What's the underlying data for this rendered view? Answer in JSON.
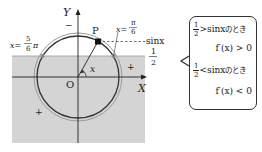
{
  "diagram": {
    "axes": {
      "x_label": "X",
      "y_label": "Y",
      "origin_label": "O"
    },
    "point": {
      "label": "P"
    },
    "angle_label": "x",
    "line_labels": {
      "sin": "sinx",
      "half_num": "1",
      "half_den": "2"
    },
    "angle_marks": [
      {
        "prefix": "x=",
        "num": "π",
        "den": "6",
        "suffix": ""
      },
      {
        "prefix": "x=",
        "num": "5",
        "den": "6",
        "suffix": "π"
      }
    ],
    "region_signs": [
      "+",
      "+",
      "−"
    ],
    "colors": {
      "shade": "#d4d4d4",
      "circle": "#333333",
      "outer_circle": "#9a9a9a",
      "axis": "#222222"
    }
  },
  "note": {
    "lines": [
      {
        "num": "1",
        "den": "2",
        "rel": ">",
        "expr": "sinx",
        "tail": "のとき"
      },
      {
        "text": "f′(x) > 0"
      },
      {
        "num": "1",
        "den": "2",
        "rel": "<",
        "expr": "sinx",
        "tail": "のとき"
      },
      {
        "text": "f′(x) < 0"
      }
    ]
  }
}
